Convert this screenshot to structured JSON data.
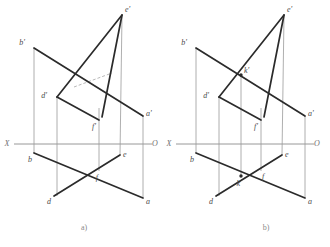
{
  "page": {
    "background_color": "#ffffff"
  },
  "styles": {
    "edge_color": "#2b2b2b",
    "projector_color": "#9a9a9a",
    "axis_color": "#7d7d7d",
    "hidden_color": "#b0b0b0",
    "label_color": "#4a4a4a",
    "caption_color": "#8a8a8a",
    "edge_width": 1.7,
    "projector_width": 0.8,
    "axis_width": 0.8
  },
  "figures": [
    {
      "id": "figure-a",
      "caption": "a)",
      "caption_pos": {
        "x": 84,
        "y": 230
      },
      "axis": {
        "label_left": "X",
        "label_right": "O",
        "label_left_pos": {
          "x": 7,
          "y": 144
        },
        "label_right_pos": {
          "x": 155,
          "y": 144
        },
        "line": {
          "x1": 14,
          "y1": 144,
          "x2": 152,
          "y2": 144
        }
      },
      "points": [
        {
          "name": "e'",
          "x": 122,
          "y": 15,
          "label_dx": 3,
          "label_dy": -5,
          "marker": false
        },
        {
          "name": "b'",
          "x": 34,
          "y": 48,
          "label_dx": -9,
          "label_dy": -5,
          "marker": false
        },
        {
          "name": "d'",
          "x": 57,
          "y": 97,
          "label_dx": -10,
          "label_dy": -1,
          "marker": false
        },
        {
          "name": "f'",
          "x": 99,
          "y": 120,
          "label_dx": -3,
          "label_dy": 7,
          "marker": false
        },
        {
          "name": "a'",
          "x": 143,
          "y": 116,
          "label_dx": 3,
          "label_dy": -2,
          "marker": false
        },
        {
          "name": "b",
          "x": 34,
          "y": 153,
          "label_dx": -2,
          "label_dy": 7,
          "marker": false
        },
        {
          "name": "e",
          "x": 120,
          "y": 155,
          "label_dx": 3,
          "label_dy": 0,
          "marker": false
        },
        {
          "name": "f",
          "x": 99,
          "y": 171,
          "label_dx": -1,
          "label_dy": 7,
          "marker": false
        },
        {
          "name": "d",
          "x": 54,
          "y": 196,
          "label_dx": -3,
          "label_dy": 6,
          "marker": false
        },
        {
          "name": "a",
          "x": 143,
          "y": 198,
          "label_dx": 3,
          "label_dy": 4,
          "marker": false
        }
      ],
      "edges": [
        {
          "name": "edge-b1-a1",
          "x1": 34,
          "y1": 48,
          "x2": 143,
          "y2": 116
        },
        {
          "name": "edge-d1-e1",
          "x1": 57,
          "y1": 97,
          "x2": 122,
          "y2": 15
        },
        {
          "name": "edge-e1-f1",
          "x1": 122,
          "y1": 15,
          "x2": 102,
          "y2": 117
        },
        {
          "name": "edge-d1-f1",
          "x1": 57,
          "y1": 97,
          "x2": 99,
          "y2": 120
        },
        {
          "name": "edge-b-a",
          "x1": 34,
          "y1": 153,
          "x2": 143,
          "y2": 198
        },
        {
          "name": "edge-d-e",
          "x1": 54,
          "y1": 196,
          "x2": 120,
          "y2": 155
        }
      ],
      "hidden_edges": [
        {
          "name": "hidden-d1-to-chord",
          "x1": 74,
          "y1": 87,
          "x2": 112,
          "y2": 73
        }
      ],
      "projectors": [
        {
          "name": "projector-b",
          "x1": 34,
          "y1": 48,
          "x2": 34,
          "y2": 153
        },
        {
          "name": "projector-d",
          "x1": 57,
          "y1": 97,
          "x2": 57,
          "y2": 196
        },
        {
          "name": "projector-f",
          "x1": 99,
          "y1": 108,
          "x2": 99,
          "y2": 171
        },
        {
          "name": "projector-e",
          "x1": 122,
          "y1": 15,
          "x2": 120,
          "y2": 155
        },
        {
          "name": "projector-a",
          "x1": 143,
          "y1": 116,
          "x2": 143,
          "y2": 198
        }
      ]
    },
    {
      "id": "figure-b",
      "caption": "b)",
      "caption_pos": {
        "x": 266,
        "y": 230
      },
      "axis": {
        "label_left": "X",
        "label_right": "O",
        "label_left_pos": {
          "x": 169,
          "y": 144
        },
        "label_right_pos": {
          "x": 317,
          "y": 144
        },
        "line": {
          "x1": 176,
          "y1": 144,
          "x2": 314,
          "y2": 144
        }
      },
      "points": [
        {
          "name": "e'",
          "x": 284,
          "y": 15,
          "label_dx": 3,
          "label_dy": -5,
          "marker": false
        },
        {
          "name": "b'",
          "x": 196,
          "y": 48,
          "label_dx": -9,
          "label_dy": -5,
          "marker": false
        },
        {
          "name": "k'",
          "x": 241,
          "y": 75,
          "label_dx": 3,
          "label_dy": -4,
          "marker": true
        },
        {
          "name": "d'",
          "x": 219,
          "y": 97,
          "label_dx": -10,
          "label_dy": -1,
          "marker": false
        },
        {
          "name": "f'",
          "x": 261,
          "y": 120,
          "label_dx": -3,
          "label_dy": 7,
          "marker": false
        },
        {
          "name": "a'",
          "x": 305,
          "y": 116,
          "label_dx": 3,
          "label_dy": -2,
          "marker": false
        },
        {
          "name": "b",
          "x": 196,
          "y": 153,
          "label_dx": -2,
          "label_dy": 7,
          "marker": false
        },
        {
          "name": "e",
          "x": 282,
          "y": 155,
          "label_dx": 3,
          "label_dy": 0,
          "marker": false
        },
        {
          "name": "f",
          "x": 261,
          "y": 171,
          "label_dx": 1,
          "label_dy": 6,
          "marker": false
        },
        {
          "name": "k",
          "x": 241,
          "y": 176,
          "label_dx": -1,
          "label_dy": 8,
          "marker": true
        },
        {
          "name": "d",
          "x": 216,
          "y": 196,
          "label_dx": -3,
          "label_dy": 6,
          "marker": false
        },
        {
          "name": "a",
          "x": 305,
          "y": 198,
          "label_dx": 3,
          "label_dy": 4,
          "marker": false
        }
      ],
      "edges": [
        {
          "name": "edge-b1-a1",
          "x1": 196,
          "y1": 48,
          "x2": 305,
          "y2": 116
        },
        {
          "name": "edge-d1-e1",
          "x1": 219,
          "y1": 97,
          "x2": 284,
          "y2": 15
        },
        {
          "name": "edge-e1-f1",
          "x1": 284,
          "y1": 15,
          "x2": 264,
          "y2": 117
        },
        {
          "name": "edge-d1-f1",
          "x1": 219,
          "y1": 97,
          "x2": 261,
          "y2": 120
        },
        {
          "name": "edge-b-a",
          "x1": 196,
          "y1": 153,
          "x2": 305,
          "y2": 198
        },
        {
          "name": "edge-d-e",
          "x1": 216,
          "y1": 196,
          "x2": 282,
          "y2": 155
        }
      ],
      "hidden_edges": [],
      "projectors": [
        {
          "name": "projector-b",
          "x1": 196,
          "y1": 48,
          "x2": 196,
          "y2": 153
        },
        {
          "name": "projector-d",
          "x1": 219,
          "y1": 97,
          "x2": 219,
          "y2": 196
        },
        {
          "name": "projector-k",
          "x1": 241,
          "y1": 75,
          "x2": 241,
          "y2": 176
        },
        {
          "name": "projector-f",
          "x1": 261,
          "y1": 108,
          "x2": 261,
          "y2": 171
        },
        {
          "name": "projector-e",
          "x1": 284,
          "y1": 15,
          "x2": 282,
          "y2": 155
        },
        {
          "name": "projector-a",
          "x1": 305,
          "y1": 116,
          "x2": 305,
          "y2": 198
        }
      ]
    }
  ]
}
